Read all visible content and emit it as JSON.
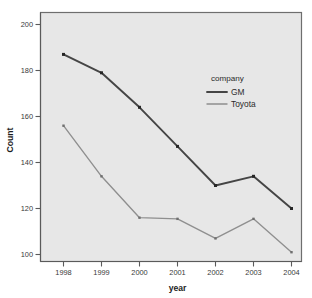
{
  "chart_data": {
    "type": "line",
    "title": "",
    "xlabel": "year",
    "ylabel": "Count",
    "categories": [
      "1998",
      "1999",
      "2000",
      "2001",
      "2002",
      "2003",
      "2004"
    ],
    "x": [
      1998,
      1999,
      2000,
      2001,
      2002,
      2003,
      2004
    ],
    "series": [
      {
        "name": "GM",
        "color": "#454545",
        "values": [
          187,
          179,
          164,
          147,
          130,
          134,
          120
        ]
      },
      {
        "name": "Toyota",
        "color": "#8f8f8f",
        "values": [
          156,
          134,
          116,
          115.5,
          107,
          115.5,
          101
        ]
      }
    ],
    "ylim": [
      95,
      204
    ],
    "yticks": [
      100,
      120,
      140,
      160,
      180,
      200
    ],
    "ytick_labels": [
      "100",
      "120",
      "140",
      "160",
      "180",
      "200"
    ],
    "xtick_labels": [
      "1998",
      "1999",
      "2000",
      "2001",
      "2002",
      "2003",
      "2004"
    ],
    "grid": false,
    "legend": {
      "title": "company",
      "position": "inside-upper-right",
      "entries": [
        "GM",
        "Toyota"
      ]
    },
    "plot_background": "#e7e7e7",
    "figure_background": "#ffffff",
    "marker": "square"
  },
  "axes": {
    "y_title": "Count",
    "x_title": "year"
  },
  "legend": {
    "title": "company",
    "gm_label": "GM",
    "toyota_label": "Toyota"
  },
  "yticks": {
    "t0": "200",
    "t1": "180",
    "t2": "160",
    "t3": "140",
    "t4": "120",
    "t5": "100"
  },
  "xticks": {
    "t0": "1998",
    "t1": "1999",
    "t2": "2000",
    "t3": "2001",
    "t4": "2002",
    "t5": "2003",
    "t6": "2004"
  }
}
